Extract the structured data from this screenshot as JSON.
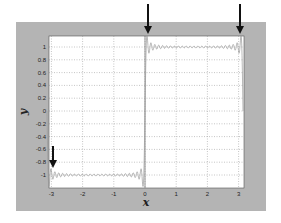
{
  "chart_data": {
    "type": "line",
    "title": "",
    "xlabel": "x",
    "ylabel": "y",
    "xlim": [
      -3.14159,
      3.14159
    ],
    "ylim": [
      -1.15,
      1.15
    ],
    "grid": true,
    "x_ticks": [
      -3,
      -2,
      -1,
      0,
      1,
      2,
      3
    ],
    "x_tick_labels": [
      "-3",
      "-2",
      "-1",
      "0",
      "1",
      "2",
      "3"
    ],
    "y_ticks": [
      1,
      0.8,
      0.6,
      0.4,
      0.2,
      0,
      -0.2,
      -0.4,
      -0.6,
      -0.8,
      -1
    ],
    "y_tick_labels": [
      "1",
      "0.8",
      "0.6",
      "0.4",
      "0.2",
      "0",
      "-0.2",
      "-0.4",
      "-0.6",
      "-0.8",
      "-1"
    ],
    "series": [
      {
        "name": "Fourier partial sum of square wave (Gibbs phenomenon)",
        "description": "y ≈ -1 for -π<x<0, y ≈ 1 for 0<x<π, with overshoot ripples near discontinuities",
        "segments": [
          {
            "x_range": [
              -3.14159,
              0
            ],
            "level": -1
          },
          {
            "x_range": [
              0,
              3.14159
            ],
            "level": 1
          }
        ],
        "harmonics": 25,
        "color": "#9a9a9a"
      }
    ],
    "annotations": [
      {
        "type": "arrow",
        "points_to_x": -3.14,
        "points_to_y": -1,
        "direction": "down"
      },
      {
        "type": "arrow",
        "points_to_x": 0,
        "points_to_y": 1.1,
        "direction": "down"
      },
      {
        "type": "arrow",
        "points_to_x": 3.14,
        "points_to_y": 1.1,
        "direction": "down"
      }
    ],
    "vertical_line": {
      "x": 0,
      "color": "#808080"
    }
  },
  "colors": {
    "figure_bg": "#b4b4b4",
    "axes_bg": "#ffffff",
    "grid": "#8c8c8c",
    "line": "#9a9a9a",
    "arrow": "#111111"
  }
}
